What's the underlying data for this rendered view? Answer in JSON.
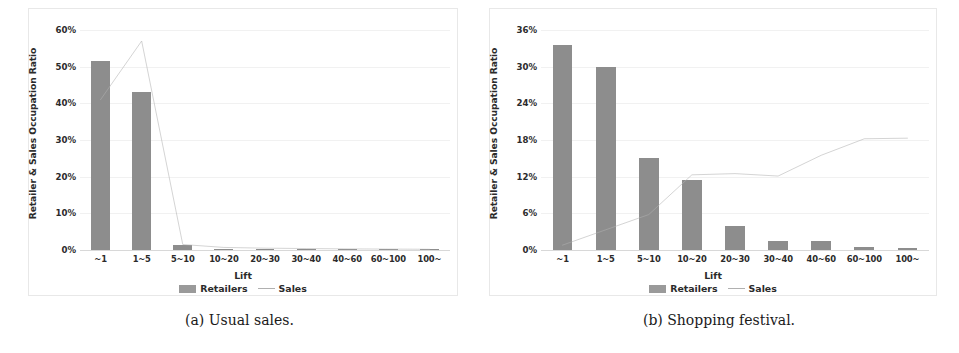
{
  "figure": {
    "panels": [
      {
        "caption": "(a) Usual sales.",
        "ylabel": "Retailer & Sales Occupation Ratio",
        "xlabel": "Lift",
        "legend": [
          {
            "label": "Retailers",
            "marker": "bar-swatch",
            "color": "#8d8d8d"
          },
          {
            "label": "Sales",
            "marker": "line-swatch",
            "color": "#b0b0b0"
          }
        ],
        "yticks": [
          "60%",
          "50%",
          "40%",
          "30%",
          "20%",
          "10%",
          "0%"
        ],
        "xticks": [
          "~1",
          "1~5",
          "5~10",
          "10~20",
          "20~30",
          "30~40",
          "40~60",
          "60~100",
          "100~"
        ]
      },
      {
        "caption": "(b) Shopping festival.",
        "ylabel": "Retailer & Sales Occupation Ratio",
        "xlabel": "Lift",
        "legend": [
          {
            "label": "Retailers",
            "marker": "bar-swatch",
            "color": "#8d8d8d"
          },
          {
            "label": "Sales",
            "marker": "line-swatch",
            "color": "#b0b0b0"
          }
        ],
        "yticks": [
          "36%",
          "30%",
          "24%",
          "18%",
          "12%",
          "6%",
          "0%"
        ],
        "xticks": [
          "~1",
          "1~5",
          "5~10",
          "10~20",
          "20~30",
          "30~40",
          "40~60",
          "60~100",
          "100~"
        ]
      }
    ]
  },
  "chart_data": [
    {
      "type": "bar",
      "title": "(a) Usual sales.",
      "xlabel": "Lift",
      "ylabel": "Retailer & Sales Occupation Ratio",
      "categories": [
        "~1",
        "1~5",
        "5~10",
        "10~20",
        "20~30",
        "30~40",
        "40~60",
        "60~100",
        "100~"
      ],
      "series": [
        {
          "name": "Retailers",
          "type": "bar",
          "color": "#8d8d8d",
          "values": [
            51.5,
            43.0,
            1.5,
            0.25,
            0.15,
            0.1,
            0.08,
            0.05,
            0.03
          ]
        },
        {
          "name": "Sales",
          "type": "line",
          "color": "#b0b0b0",
          "values": [
            41.0,
            57.0,
            1.5,
            0.7,
            0.5,
            0.4,
            0.3,
            0.25,
            0.2
          ]
        }
      ],
      "ylim": [
        0,
        60
      ],
      "ytick_values": [
        0,
        10,
        20,
        30,
        40,
        50,
        60
      ],
      "ytick_labels": [
        "0%",
        "10%",
        "20%",
        "30%",
        "40%",
        "50%",
        "60%"
      ],
      "grid": true,
      "legend_position": "bottom"
    },
    {
      "type": "bar",
      "title": "(b) Shopping festival.",
      "xlabel": "Lift",
      "ylabel": "Retailer & Sales Occupation Ratio",
      "categories": [
        "~1",
        "1~5",
        "5~10",
        "10~20",
        "20~30",
        "30~40",
        "40~60",
        "60~100",
        "100~"
      ],
      "series": [
        {
          "name": "Retailers",
          "type": "bar",
          "color": "#8d8d8d",
          "values": [
            33.5,
            30.0,
            15.0,
            11.5,
            4.0,
            1.5,
            1.4,
            0.5,
            0.25
          ]
        },
        {
          "name": "Sales",
          "type": "line",
          "color": "#b0b0b0",
          "values": [
            0.8,
            3.3,
            5.8,
            12.3,
            12.5,
            12.1,
            15.5,
            18.2,
            18.3
          ]
        }
      ],
      "ylim": [
        0,
        36
      ],
      "ytick_values": [
        0,
        6,
        12,
        18,
        24,
        30,
        36
      ],
      "ytick_labels": [
        "0%",
        "6%",
        "12%",
        "18%",
        "24%",
        "30%",
        "36%"
      ],
      "grid": true,
      "legend_position": "bottom"
    }
  ]
}
